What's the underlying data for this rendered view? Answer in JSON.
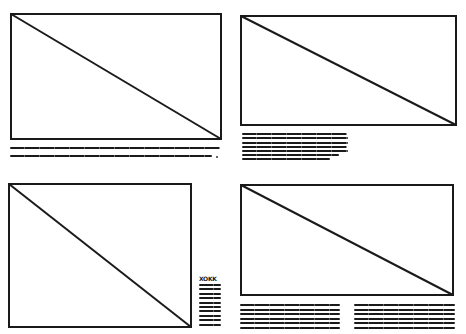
{
  "figure": {
    "panels": [
      {
        "id": "top-left",
        "frame": {
          "x": 10,
          "y": 13,
          "w": 212,
          "h": 127
        },
        "diagonal": "top-left-to-bottom-right",
        "caption_lines": [
          {
            "x": 10,
            "y": 147,
            "w": 210
          },
          {
            "x": 10,
            "y": 155,
            "w": 202
          }
        ],
        "caption_end_mark": "."
      },
      {
        "id": "top-right",
        "frame": {
          "x": 240,
          "y": 15,
          "w": 217,
          "h": 111
        },
        "diagonal": "top-left-to-bottom-right",
        "caption_lines": [
          {
            "x": 242,
            "y": 133,
            "w": 105
          },
          {
            "x": 242,
            "y": 137,
            "w": 106
          },
          {
            "x": 242,
            "y": 142,
            "w": 106
          },
          {
            "x": 242,
            "y": 146,
            "w": 105
          },
          {
            "x": 242,
            "y": 150,
            "w": 106
          },
          {
            "x": 242,
            "y": 154,
            "w": 97
          },
          {
            "x": 242,
            "y": 158,
            "w": 88
          }
        ]
      },
      {
        "id": "bottom-left",
        "frame": {
          "x": 8,
          "y": 183,
          "w": 184,
          "h": 145
        },
        "diagonal": "top-left-to-bottom-right",
        "legend": {
          "x": 199,
          "y": 282,
          "header": "XOKK",
          "line_count": 10,
          "line_width": 22
        }
      },
      {
        "id": "bottom-right",
        "frame": {
          "x": 240,
          "y": 184,
          "w": 214,
          "h": 112
        },
        "diagonal": "top-left-to-bottom-right",
        "caption_columns": [
          {
            "x": 240,
            "w": 100,
            "lines": 6
          },
          {
            "x": 354,
            "w": 101,
            "lines": 6
          }
        ],
        "caption_top": 304,
        "caption_line_gap": 4.6
      }
    ],
    "colors": {
      "ink": "#1a1a1a",
      "paper": "#ffffff"
    }
  }
}
